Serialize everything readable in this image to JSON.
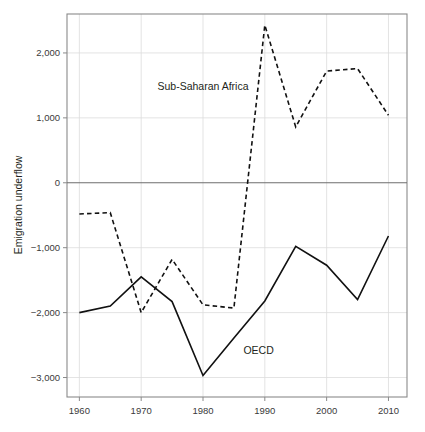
{
  "chart_data": {
    "type": "line",
    "title": "",
    "xlabel": "",
    "ylabel": "Emigration underflow",
    "xlim": [
      1958,
      2013
    ],
    "ylim": [
      -3300,
      2600
    ],
    "xticks": [
      1960,
      1970,
      1980,
      1990,
      2000,
      2010
    ],
    "xtick_labels": [
      "1960",
      "1970",
      "1980",
      "1990",
      "2000",
      "2010"
    ],
    "yticks": [
      2000,
      1000,
      0,
      -1000,
      -2000,
      -3000
    ],
    "ytick_labels": [
      "2,000",
      "1,000",
      "0",
      "−1,000",
      "−2,000",
      "−3,000"
    ],
    "grid": true,
    "legend_position": "inline-annotations",
    "x": [
      1960,
      1965,
      1970,
      1975,
      1980,
      1985,
      1990,
      1995,
      2000,
      2005,
      2010
    ],
    "series": [
      {
        "name": "Sub-Saharan Africa",
        "style": "dashed",
        "color": "#111111",
        "values": [
          -480,
          -460,
          -2000,
          -1180,
          -1880,
          -1930,
          2430,
          860,
          1720,
          1760,
          1040
        ],
        "label_x": 1980,
        "label_y": 1430
      },
      {
        "name": "OECD",
        "style": "solid",
        "color": "#111111",
        "values": [
          -2000,
          -1900,
          -1450,
          -1830,
          -2970,
          -2390,
          -1820,
          -980,
          -1270,
          -1800,
          -820
        ],
        "label_x": 1989,
        "label_y": -2640
      }
    ]
  },
  "annotations": {
    "sub_saharan_africa_label": "Sub-Saharan Africa",
    "oecd_label": "OECD"
  },
  "axis": {
    "y_title": "Emigration underflow"
  }
}
